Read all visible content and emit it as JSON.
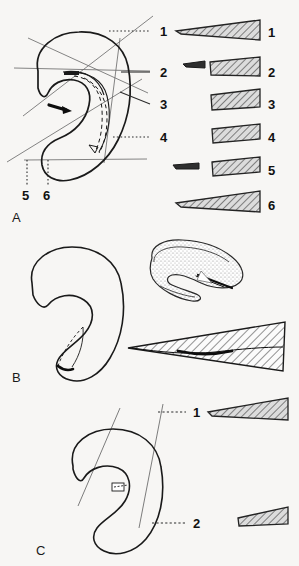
{
  "figure": {
    "background_color": "#f7f6f4",
    "ink_color": "#1a1a1a",
    "hatch_color": "#3a3a3a",
    "hatch_fill_color": "#d8d8d8",
    "stipple_color": "#9a9a9a",
    "section_line_color": "#6e6e6e",
    "leader_line_color": "#2b2b2b"
  },
  "panels": [
    {
      "id": "A",
      "label": "A",
      "label_x": 14,
      "label_y": 219,
      "outline_name": "meniscus-outline-a",
      "section_planes": 6,
      "leaders": [
        {
          "number": "1",
          "x": 160,
          "y": 31,
          "line_from_x": 109,
          "line_to_x": 150,
          "line_y": 31,
          "style": "dotted-horizontal"
        },
        {
          "number": "2",
          "x": 160,
          "y": 72,
          "line_from_x": 121,
          "line_to_x": 150,
          "line_y": 72,
          "style": "solid-horizontal"
        },
        {
          "number": "3",
          "x": 160,
          "y": 104,
          "line_from_x": 120,
          "line_to_x": 150,
          "line_y": 104,
          "style": "solid-diagonal"
        },
        {
          "number": "4",
          "x": 160,
          "y": 137,
          "line_from_x": 113,
          "line_to_x": 150,
          "line_y": 137,
          "style": "dotted-horizontal"
        },
        {
          "number": "5",
          "x": 23,
          "y": 196,
          "line_x": 27,
          "line_from_y": 160,
          "line_to_y": 186,
          "style": "dotted-vertical"
        },
        {
          "number": "6",
          "x": 45,
          "y": 196,
          "line_x": 48,
          "line_from_y": 160,
          "line_to_y": 186,
          "style": "dotted-vertical"
        }
      ],
      "sections": [
        {
          "number": "1",
          "label_x": 286,
          "label_y": 32,
          "shape": "long-slender-wedge",
          "has_tip_sliver": false,
          "width": 88,
          "height": 22
        },
        {
          "number": "2",
          "label_x": 286,
          "label_y": 72,
          "shape": "trapezoid-with-detached-sliver",
          "has_tip_sliver": true,
          "width": 52,
          "height": 19
        },
        {
          "number": "3",
          "label_x": 286,
          "label_y": 104,
          "shape": "trapezoid",
          "has_tip_sliver": false,
          "width": 50,
          "height": 18
        },
        {
          "number": "4",
          "label_x": 286,
          "label_y": 137,
          "shape": "trapezoid",
          "has_tip_sliver": false,
          "width": 50,
          "height": 16
        },
        {
          "number": "5",
          "label_x": 286,
          "label_y": 170,
          "shape": "trapezoid-with-detached-sliver",
          "has_tip_sliver": true,
          "width": 50,
          "height": 15
        },
        {
          "number": "6",
          "label_x": 286,
          "label_y": 205,
          "shape": "long-slender-wedge",
          "has_tip_sliver": false,
          "width": 88,
          "height": 20
        }
      ]
    },
    {
      "id": "B",
      "label": "B",
      "label_x": 14,
      "label_y": 378,
      "outline_name": "meniscus-outline-b",
      "has_stippled_3d_view": true,
      "stippled_view_name": "meniscus-3d-stippled-b",
      "has_large_section_wedge": true,
      "large_section_name": "section-wedge-b",
      "section_planes": 0,
      "leaders": [],
      "sections": []
    },
    {
      "id": "C",
      "label": "C",
      "label_x": 38,
      "label_y": 551,
      "outline_name": "meniscus-outline-c",
      "section_planes": 2,
      "leaders": [
        {
          "number": "1",
          "x": 196,
          "y": 412,
          "line_from_x": 158,
          "line_to_x": 186,
          "line_y": 412,
          "style": "dashed-horizontal"
        },
        {
          "number": "2",
          "x": 196,
          "y": 523,
          "line_from_x": 158,
          "line_to_x": 186,
          "line_y": 523,
          "style": "dashed-horizontal"
        }
      ],
      "sections": [
        {
          "number": "1",
          "label_x": 0,
          "label_y": 0,
          "shape": "long-slender-wedge",
          "has_tip_sliver": false,
          "width": 78,
          "height": 18
        },
        {
          "number": "2",
          "label_x": 0,
          "label_y": 0,
          "shape": "trapezoid",
          "has_tip_sliver": false,
          "width": 48,
          "height": 14
        }
      ]
    }
  ],
  "labels": {
    "panel_a": "A",
    "panel_b": "B",
    "panel_c": "C",
    "a_leader_1": "1",
    "a_leader_2": "2",
    "a_leader_3": "3",
    "a_leader_4": "4",
    "a_leader_5": "5",
    "a_leader_6": "6",
    "a_section_1": "1",
    "a_section_2": "2",
    "a_section_3": "3",
    "a_section_4": "4",
    "a_section_5": "5",
    "a_section_6": "6",
    "c_leader_1": "1",
    "c_leader_2": "2"
  }
}
